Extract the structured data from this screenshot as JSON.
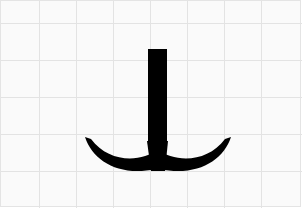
{
  "image": {
    "description": "Calligraphic glyph on grid paper: vertical stroke ending in two curved crescent strokes",
    "glyph_color": "#000000",
    "background_color": "#fafafa",
    "grid_color": "#e2e2e2",
    "grid_spacing_px": 37
  }
}
